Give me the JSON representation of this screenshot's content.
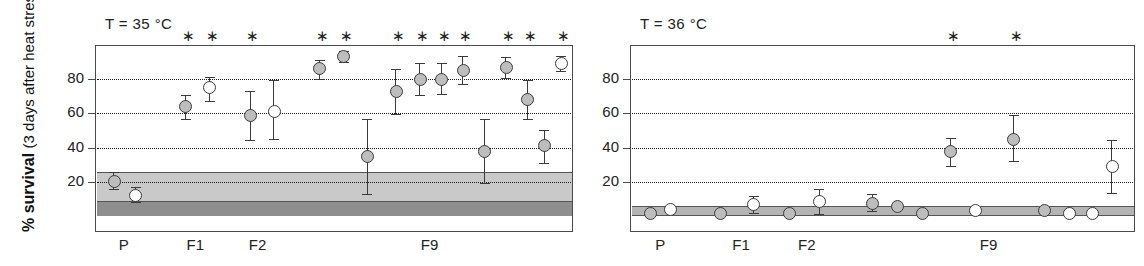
{
  "figure": {
    "y_axis_title_line1": "% survival",
    "y_axis_title_line2": "(3 days after heat stress)"
  },
  "chart_data": [
    {
      "type": "scatter",
      "title": "T = 35 °C",
      "panel": "left",
      "xlabel": "",
      "ylabel": "% survival (3 days after heat stress)",
      "ylim": [
        0,
        100
      ],
      "yticks": [
        20,
        40,
        60,
        80
      ],
      "ytick_labels": [
        "20",
        "40",
        "60",
        "80"
      ],
      "grid": "horizontal-dotted",
      "legend": "none",
      "group_labels": [
        {
          "label": "P",
          "x_center_pct": 6
        },
        {
          "label": "F1",
          "x_center_pct": 21
        },
        {
          "label": "F2",
          "x_center_pct": 34
        },
        {
          "label": "F9",
          "x_center_pct": 70
        }
      ],
      "reference_bands": [
        {
          "name": "control-range-light",
          "y_low": 8,
          "y_high": 26,
          "color": "#c9c9c9"
        },
        {
          "name": "control-range-dark",
          "y_low": 0,
          "y_high": 8,
          "color": "#8e8e8e"
        }
      ],
      "points": [
        {
          "group": "P",
          "x_pct": 4.0,
          "value": 20.0,
          "err_low": 16.0,
          "err_high": 26.0,
          "fill": "filled",
          "significant": false
        },
        {
          "group": "P",
          "x_pct": 8.5,
          "value": 12.0,
          "err_low": 8.0,
          "err_high": 17.0,
          "fill": "open",
          "significant": false
        },
        {
          "group": "F1",
          "x_pct": 19.0,
          "value": 64.0,
          "err_low": 57.0,
          "err_high": 71.0,
          "fill": "filled",
          "significant": true
        },
        {
          "group": "F1",
          "x_pct": 24.0,
          "value": 75.0,
          "err_low": 67.0,
          "err_high": 81.0,
          "fill": "open",
          "significant": true
        },
        {
          "group": "F2",
          "x_pct": 32.5,
          "value": 58.5,
          "err_low": 44.5,
          "err_high": 73.0,
          "fill": "filled",
          "significant": true
        },
        {
          "group": "F2",
          "x_pct": 37.5,
          "value": 61.0,
          "err_low": 45.0,
          "err_high": 79.5,
          "fill": "open",
          "significant": false
        },
        {
          "group": "F9",
          "x_pct": 47.0,
          "value": 86.0,
          "err_low": 80.0,
          "err_high": 91.0,
          "fill": "filled",
          "significant": true
        },
        {
          "group": "F9",
          "x_pct": 52.0,
          "value": 93.0,
          "err_low": 90.0,
          "err_high": 96.5,
          "fill": "filled",
          "significant": true
        },
        {
          "group": "F9",
          "x_pct": 57.0,
          "value": 35.0,
          "err_low": 13.0,
          "err_high": 57.0,
          "fill": "filled",
          "significant": false
        },
        {
          "group": "F9",
          "x_pct": 63.0,
          "value": 73.0,
          "err_low": 59.5,
          "err_high": 86.0,
          "fill": "filled",
          "significant": true
        },
        {
          "group": "F9",
          "x_pct": 68.0,
          "value": 80.0,
          "err_low": 71.0,
          "err_high": 89.5,
          "fill": "filled",
          "significant": true
        },
        {
          "group": "F9",
          "x_pct": 72.5,
          "value": 80.0,
          "err_low": 71.5,
          "err_high": 89.5,
          "fill": "filled",
          "significant": true
        },
        {
          "group": "F9",
          "x_pct": 77.0,
          "value": 85.0,
          "err_low": 77.0,
          "err_high": 93.5,
          "fill": "filled",
          "significant": true
        },
        {
          "group": "F9",
          "x_pct": 81.5,
          "value": 38.0,
          "err_low": 19.5,
          "err_high": 57.0,
          "fill": "filled",
          "significant": false
        },
        {
          "group": "F9",
          "x_pct": 86.0,
          "value": 87.0,
          "err_low": 80.5,
          "err_high": 93.0,
          "fill": "filled",
          "significant": true
        },
        {
          "group": "F9",
          "x_pct": 90.5,
          "value": 68.0,
          "err_low": 57.0,
          "err_high": 79.5,
          "fill": "filled",
          "significant": true
        },
        {
          "group": "F9",
          "x_pct": 94.0,
          "value": 41.0,
          "err_low": 31.0,
          "err_high": 50.5,
          "fill": "filled",
          "significant": false
        },
        {
          "group": "F9",
          "x_pct": 97.5,
          "value": 89.0,
          "err_low": 85.0,
          "err_high": 93.5,
          "fill": "open",
          "significant": true
        }
      ]
    },
    {
      "type": "scatter",
      "title": "T = 36 °C",
      "panel": "right",
      "xlabel": "",
      "ylabel": "",
      "ylim": [
        0,
        100
      ],
      "yticks": [
        20,
        40,
        60,
        80
      ],
      "ytick_labels": [
        "20",
        "40",
        "60",
        "80"
      ],
      "grid": "horizontal-dotted",
      "legend": "none",
      "group_labels": [
        {
          "label": "P",
          "x_center_pct": 6
        },
        {
          "label": "F1",
          "x_center_pct": 22
        },
        {
          "label": "F2",
          "x_center_pct": 35
        },
        {
          "label": "F9",
          "x_center_pct": 71
        }
      ],
      "reference_bands": [
        {
          "name": "control-range-thin",
          "y_low": 0,
          "y_high": 6,
          "color": "#b4b4b4"
        }
      ],
      "points": [
        {
          "group": "P",
          "x_pct": 4.0,
          "value": 1.5,
          "err_low": 1.5,
          "err_high": 1.5,
          "fill": "filled",
          "significant": false
        },
        {
          "group": "P",
          "x_pct": 8.0,
          "value": 4.0,
          "err_low": 4.0,
          "err_high": 4.0,
          "fill": "open",
          "significant": false
        },
        {
          "group": "F1",
          "x_pct": 18.0,
          "value": 1.5,
          "err_low": 1.5,
          "err_high": 1.5,
          "fill": "filled",
          "significant": false
        },
        {
          "group": "F1",
          "x_pct": 24.5,
          "value": 6.5,
          "err_low": 1.5,
          "err_high": 11.5,
          "fill": "open",
          "significant": false
        },
        {
          "group": "F2",
          "x_pct": 31.5,
          "value": 1.5,
          "err_low": 1.5,
          "err_high": 1.5,
          "fill": "filled",
          "significant": false
        },
        {
          "group": "F2",
          "x_pct": 37.5,
          "value": 8.5,
          "err_low": 1.0,
          "err_high": 16.0,
          "fill": "open",
          "significant": false
        },
        {
          "group": "F9",
          "x_pct": 48.0,
          "value": 7.5,
          "err_low": 3.0,
          "err_high": 13.0,
          "fill": "filled",
          "significant": false
        },
        {
          "group": "F9",
          "x_pct": 53.0,
          "value": 5.5,
          "err_low": 5.5,
          "err_high": 5.5,
          "fill": "filled",
          "significant": false
        },
        {
          "group": "F9",
          "x_pct": 58.0,
          "value": 1.5,
          "err_low": 1.5,
          "err_high": 1.5,
          "fill": "filled",
          "significant": false
        },
        {
          "group": "F9",
          "x_pct": 63.5,
          "value": 37.5,
          "err_low": 29.5,
          "err_high": 45.5,
          "fill": "filled",
          "significant": true
        },
        {
          "group": "F9",
          "x_pct": 68.5,
          "value": 3.5,
          "err_low": 3.5,
          "err_high": 3.5,
          "fill": "open",
          "significant": false
        },
        {
          "group": "F9",
          "x_pct": 76.0,
          "value": 45.0,
          "err_low": 32.0,
          "err_high": 59.0,
          "fill": "filled",
          "significant": true
        },
        {
          "group": "F9",
          "x_pct": 82.0,
          "value": 3.5,
          "err_low": 3.5,
          "err_high": 3.5,
          "fill": "filled",
          "significant": false
        },
        {
          "group": "F9",
          "x_pct": 87.0,
          "value": 1.5,
          "err_low": 1.5,
          "err_high": 1.5,
          "fill": "open",
          "significant": false
        },
        {
          "group": "F9",
          "x_pct": 91.5,
          "value": 1.5,
          "err_low": 1.5,
          "err_high": 1.5,
          "fill": "open",
          "significant": false
        },
        {
          "group": "F9",
          "x_pct": 95.5,
          "value": 29.0,
          "err_low": 13.5,
          "err_high": 44.5,
          "fill": "open",
          "significant": false
        }
      ]
    }
  ]
}
